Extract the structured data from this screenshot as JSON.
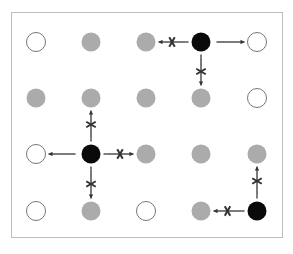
{
  "caption": "",
  "grid": {
    "columns": 5,
    "rows": 4,
    "col_x": [
      36,
      91,
      146,
      201,
      257
    ],
    "row_y": [
      42,
      98,
      154,
      211
    ],
    "radius": 9.5,
    "colors": {
      "white": "#ffffff",
      "gray": "#ababab",
      "black": "#0a0a0a",
      "stroke": "#777777",
      "arrow": "#333333"
    },
    "cells": [
      [
        "white",
        "gray",
        "gray",
        "black",
        "white"
      ],
      [
        "gray",
        "gray",
        "gray",
        "gray",
        "white"
      ],
      [
        "white",
        "black",
        "gray",
        "gray",
        "gray"
      ],
      [
        "white",
        "gray",
        "white",
        "gray",
        "black"
      ]
    ]
  },
  "connectors": [
    {
      "from": [
        0,
        3
      ],
      "to": [
        0,
        2
      ],
      "blocked": true
    },
    {
      "from": [
        0,
        3
      ],
      "to": [
        0,
        4
      ],
      "blocked": false
    },
    {
      "from": [
        0,
        3
      ],
      "to": [
        1,
        3
      ],
      "blocked": true
    },
    {
      "from": [
        2,
        1
      ],
      "to": [
        1,
        1
      ],
      "blocked": true
    },
    {
      "from": [
        2,
        1
      ],
      "to": [
        2,
        0
      ],
      "blocked": false
    },
    {
      "from": [
        2,
        1
      ],
      "to": [
        2,
        2
      ],
      "blocked": true
    },
    {
      "from": [
        2,
        1
      ],
      "to": [
        3,
        1
      ],
      "blocked": true
    },
    {
      "from": [
        3,
        4
      ],
      "to": [
        2,
        4
      ],
      "blocked": true
    },
    {
      "from": [
        3,
        4
      ],
      "to": [
        3,
        3
      ],
      "blocked": true
    }
  ]
}
